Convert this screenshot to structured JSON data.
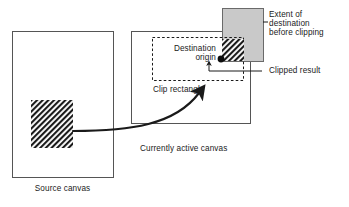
{
  "diagram": {
    "background_color": "#ffffff",
    "stroke_color": "#1a1a1a",
    "gray_fill": "#c8c8c8",
    "hatch_color": "#1a1a1a"
  },
  "labels": {
    "source_canvas": "Source canvas",
    "destination_origin_line1": "Destination",
    "destination_origin_line2": "origin",
    "clip_rectangle": "Clip rectangle",
    "currently_active_canvas": "Currently active canvas",
    "extent_line1": "Extent of",
    "extent_line2": "destination",
    "extent_line3": "before clipping",
    "clipped_result": "Clipped result"
  },
  "shapes": {
    "source_canvas_rect": {
      "x": 12,
      "y": 31,
      "w": 101,
      "h": 146
    },
    "source_hatch_rect": {
      "x": 31,
      "y": 100,
      "w": 42,
      "h": 48
    },
    "destination_canvas_rect": {
      "x": 131,
      "y": 31,
      "w": 119,
      "h": 92
    },
    "clip_rect_dashed": {
      "x": 152,
      "y": 37,
      "w": 92,
      "h": 44
    },
    "extent_gray_rect": {
      "x": 222,
      "y": 8,
      "w": 41,
      "h": 53
    },
    "clipped_hatch_rect": {
      "x": 222,
      "y": 39,
      "w": 22,
      "h": 22
    },
    "origin_dot": {
      "cx": 221,
      "cy": 59,
      "r": 3.4
    }
  },
  "connectors": {
    "big_curve_arrow": "source hatch -> destination clip area",
    "clipped_result_leader": "label Clipped result -> small up arrow under clipped hatch",
    "extent_leader": "label Extent of destination before clipping -> gray rect"
  }
}
